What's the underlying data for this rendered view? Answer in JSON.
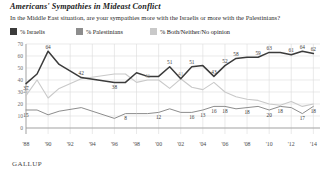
{
  "header": {
    "title": "Americans' Sympathies in Mideast Conflict",
    "subtitle": "In the Middle East situation, are your sympathies more with the Israelis or more with the Palestinians?"
  },
  "source": "GALLUP",
  "legend": [
    {
      "label": "% Israelis",
      "color": "#3b3b3b"
    },
    {
      "label": "% Palestinians",
      "color": "#8d8d8d"
    },
    {
      "label": "% Both/Neither/No opinion",
      "color": "#c9c9c9"
    }
  ],
  "chart_data": {
    "type": "line",
    "title": "Americans' Sympathies in Mideast Conflict",
    "subtitle": "In the Middle East situation, are your sympathies more with the Israelis or more with the Palestinians?",
    "xlabel": "",
    "ylabel": "",
    "ylim": [
      0,
      70
    ],
    "yticks": [
      0,
      10,
      20,
      30,
      40,
      50,
      60,
      70
    ],
    "xticks": [
      "'88",
      "'90",
      "'92",
      "'94",
      "'96",
      "'98",
      "'00",
      "'02",
      "'04",
      "'06",
      "'08",
      "'10",
      "'12",
      "'14"
    ],
    "grid": true,
    "legend_position": "top-left",
    "x": [
      1988,
      1989,
      1990,
      1991,
      1993,
      1996,
      1997,
      1998,
      1999,
      2000,
      2001,
      2002,
      2003,
      2004,
      2005,
      2006,
      2007,
      2008,
      2009,
      2010,
      2011,
      2012,
      2013,
      2014
    ],
    "series": [
      {
        "name": "% Israelis",
        "color": "#3b3b3b",
        "values": [
          37,
          45,
          64,
          53,
          42,
          38,
          38,
          46,
          43,
          43,
          51,
          41,
          51,
          52,
          43,
          52,
          58,
          59,
          59,
          63,
          63,
          61,
          64,
          62
        ],
        "labels": {
          "1988": "37",
          "1990": "64",
          "1993": "42",
          "1996": "38",
          "2001": "51",
          "2003": "51",
          "2005": "43",
          "2006": "52",
          "2007": "58",
          "2009": "59",
          "2010": "63",
          "2012": "61",
          "2013": "64",
          "2014": "62"
        }
      },
      {
        "name": "% Both/Neither/No opinion",
        "color": "#c9c9c9",
        "values": [
          27,
          40,
          25,
          33,
          41,
          45,
          45,
          38,
          40,
          40,
          33,
          41,
          34,
          32,
          38,
          30,
          26,
          24,
          23,
          20,
          19,
          22,
          18,
          20
        ],
        "labels": {
          "1988": "27",
          "1999": "41",
          "2002": "41"
        }
      },
      {
        "name": "% Palestinians",
        "color": "#8d8d8d",
        "values": [
          15,
          15,
          11,
          14,
          17,
          8,
          12,
          12,
          12,
          13,
          16,
          13,
          13,
          15,
          18,
          18,
          16,
          17,
          18,
          15,
          18,
          17,
          12,
          18
        ],
        "labels": {
          "1988": "15",
          "1997": "8",
          "2000": "12",
          "2003": "16",
          "2004": "13",
          "2005": "16",
          "2006": "18",
          "2008": "18",
          "2010": "20",
          "2011": "18",
          "2013": "17",
          "2014": "18"
        }
      }
    ]
  }
}
